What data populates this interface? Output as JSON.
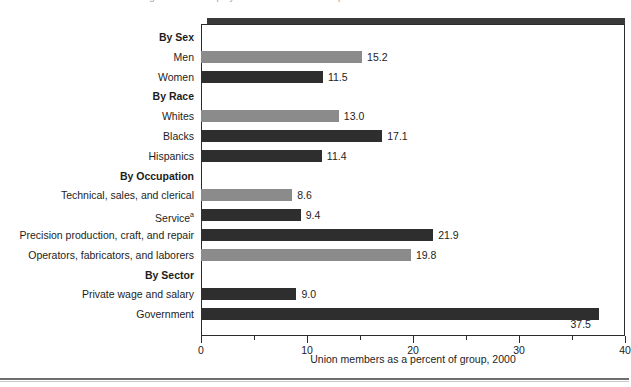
{
  "headline": {
    "clipped_text": "unionized government employees is four times that of private-sector workers."
  },
  "axis_title": "Union members as a percent of group, 2000",
  "chart_data": {
    "type": "bar",
    "orientation": "horizontal",
    "title": "",
    "xlabel": "Union members as a percent of group, 2000",
    "ylabel": "",
    "xlim": [
      0,
      40
    ],
    "xticks": [
      0,
      5,
      10,
      15,
      20,
      25,
      30,
      35,
      40
    ],
    "xtick_labels": [
      "0",
      "",
      "10",
      "",
      "20",
      "",
      "30",
      "",
      "40"
    ],
    "grid": false,
    "legend": false,
    "rows": [
      {
        "kind": "group",
        "label": "By Sex",
        "value": null,
        "shade": null
      },
      {
        "kind": "bar",
        "label": "Men",
        "value": 15.2,
        "shade": "light"
      },
      {
        "kind": "bar",
        "label": "Women",
        "value": 11.5,
        "shade": "dark"
      },
      {
        "kind": "group",
        "label": "By Race",
        "value": null,
        "shade": null
      },
      {
        "kind": "bar",
        "label": "Whites",
        "value": 13.0,
        "shade": "light"
      },
      {
        "kind": "bar",
        "label": "Blacks",
        "value": 17.1,
        "shade": "dark"
      },
      {
        "kind": "bar",
        "label": "Hispanics",
        "value": 11.4,
        "shade": "dark"
      },
      {
        "kind": "group",
        "label": "By Occupation",
        "value": null,
        "shade": null
      },
      {
        "kind": "bar",
        "label": "Technical, sales, and clerical",
        "value": 8.6,
        "shade": "light"
      },
      {
        "kind": "bar",
        "label": "Service",
        "value": 9.4,
        "shade": "dark",
        "footnote": "a"
      },
      {
        "kind": "bar",
        "label": "Precision production, craft, and repair",
        "value": 21.9,
        "shade": "dark"
      },
      {
        "kind": "bar",
        "label": "Operators, fabricators, and laborers",
        "value": 19.8,
        "shade": "light"
      },
      {
        "kind": "group",
        "label": "By Sector",
        "value": null,
        "shade": null
      },
      {
        "kind": "bar",
        "label": "Private wage and salary",
        "value": 9.0,
        "shade": "dark"
      },
      {
        "kind": "bar",
        "label": "Government",
        "value": 37.5,
        "shade": "dark"
      }
    ],
    "categories": [
      "Men",
      "Women",
      "Whites",
      "Blacks",
      "Hispanics",
      "Technical, sales, and clerical",
      "Service",
      "Precision production, craft, and repair",
      "Operators, fabricators, and laborers",
      "Private wage and salary",
      "Government"
    ],
    "values": [
      15.2,
      11.5,
      13.0,
      17.1,
      11.4,
      8.6,
      9.4,
      21.9,
      19.8,
      9.0,
      37.5
    ]
  },
  "colors": {
    "bar_light": "#8b8b8b",
    "bar_dark": "#2e2e2e",
    "frame": "#2b2b2b",
    "shadow": "#3a3a3a",
    "text": "#1d1d1d"
  }
}
